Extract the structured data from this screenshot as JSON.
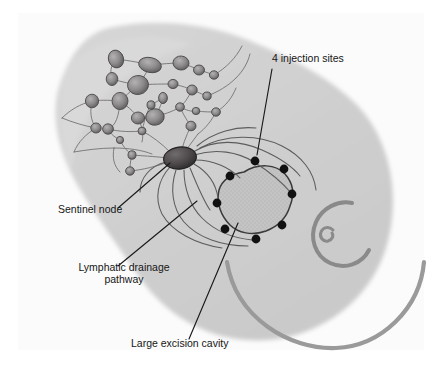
{
  "figure": {
    "kind": "medical-illustration",
    "width": 442,
    "height": 371
  },
  "colors": {
    "page_background": "#ffffff",
    "panel_background": "#fbfbfb",
    "body_silhouette": "#cfcfcf",
    "body_silhouette_light": "#d8d8d8",
    "cavity_fill": "#c2c2c2",
    "cavity_outline": "#3a3a3a",
    "sentinel_node_fill": "#4a4648",
    "lymph_node_fill": "#8e8b8d",
    "vessel_stroke": "#6d6d6d",
    "injection_dot": "#111111",
    "leader_line": "#1a1a1a",
    "label_text": "#161616",
    "areola_stroke": "#8a8a8a",
    "breast_contour": "#9a9a9a"
  },
  "labels": {
    "injection_sites": "4 injection sites",
    "sentinel_node": "Sentinel node",
    "lymphatic_drainage_line1": "Lymphatic drainage",
    "lymphatic_drainage_line2": "pathway",
    "excision_cavity": "Large excision cavity"
  },
  "anatomy": {
    "injection_site_count": 4,
    "drawn_injection_dot_count": 8,
    "sentinel_node_count": 1,
    "lymph_node_count": 26,
    "regions": [
      "axillary lymph node basin",
      "sentinel node",
      "lymphatic drainage channels",
      "large excision cavity",
      "nipple areola complex",
      "breast contour"
    ]
  },
  "injection_dots": [
    {
      "cx": 255,
      "cy": 161,
      "r": 4.4
    },
    {
      "cx": 284,
      "cy": 169,
      "r": 4.4
    },
    {
      "cx": 230,
      "cy": 176,
      "r": 4.4
    },
    {
      "cx": 292,
      "cy": 194,
      "r": 4.4
    },
    {
      "cx": 217,
      "cy": 203,
      "r": 4.4
    },
    {
      "cx": 282,
      "cy": 225,
      "r": 4.4
    },
    {
      "cx": 225,
      "cy": 229,
      "r": 4.4
    },
    {
      "cx": 256,
      "cy": 239,
      "r": 4.4
    }
  ],
  "lymph_nodes": [
    {
      "cx": 116,
      "cy": 59,
      "rx": 7.5,
      "ry": 9.0,
      "rot": -18
    },
    {
      "cx": 150,
      "cy": 65,
      "rx": 11.5,
      "ry": 7.5,
      "rot": 12
    },
    {
      "cx": 181,
      "cy": 63,
      "rx": 8.0,
      "ry": 7.0,
      "rot": 5
    },
    {
      "cx": 199,
      "cy": 70,
      "rx": 5.5,
      "ry": 5.0,
      "rot": 0
    },
    {
      "cx": 214,
      "cy": 75,
      "rx": 4.6,
      "ry": 4.2,
      "rot": 0
    },
    {
      "cx": 112,
      "cy": 79,
      "rx": 5.8,
      "ry": 6.5,
      "rot": 0
    },
    {
      "cx": 138,
      "cy": 85,
      "rx": 10.5,
      "ry": 9.5,
      "rot": -10
    },
    {
      "cx": 173,
      "cy": 84,
      "rx": 5.0,
      "ry": 4.6,
      "rot": 0
    },
    {
      "cx": 192,
      "cy": 90,
      "rx": 5.2,
      "ry": 5.0,
      "rot": 0
    },
    {
      "cx": 207,
      "cy": 96,
      "rx": 4.2,
      "ry": 4.0,
      "rot": 0
    },
    {
      "cx": 92,
      "cy": 101,
      "rx": 6.6,
      "ry": 6.8,
      "rot": 0
    },
    {
      "cx": 120,
      "cy": 101,
      "rx": 8.0,
      "ry": 8.6,
      "rot": 0
    },
    {
      "cx": 163,
      "cy": 98,
      "rx": 4.4,
      "ry": 5.6,
      "rot": 0
    },
    {
      "cx": 151,
      "cy": 105,
      "rx": 4.0,
      "ry": 4.2,
      "rot": 0
    },
    {
      "cx": 180,
      "cy": 107,
      "rx": 4.4,
      "ry": 4.2,
      "rot": 0
    },
    {
      "cx": 196,
      "cy": 111,
      "rx": 3.8,
      "ry": 3.6,
      "rot": 0
    },
    {
      "cx": 216,
      "cy": 112,
      "rx": 4.4,
      "ry": 4.2,
      "rot": 0
    },
    {
      "cx": 138,
      "cy": 118,
      "rx": 6.6,
      "ry": 6.0,
      "rot": 0
    },
    {
      "cx": 155,
      "cy": 117,
      "rx": 9.2,
      "ry": 8.2,
      "rot": -8
    },
    {
      "cx": 191,
      "cy": 126,
      "rx": 5.0,
      "ry": 4.8,
      "rot": 0
    },
    {
      "cx": 108,
      "cy": 129,
      "rx": 5.4,
      "ry": 5.2,
      "rot": 0
    },
    {
      "cx": 142,
      "cy": 131,
      "rx": 4.0,
      "ry": 3.8,
      "rot": 0
    },
    {
      "cx": 96,
      "cy": 128,
      "rx": 5.2,
      "ry": 5.0,
      "rot": 0
    },
    {
      "cx": 120,
      "cy": 140,
      "rx": 3.6,
      "ry": 3.6,
      "rot": 0
    },
    {
      "cx": 132,
      "cy": 155,
      "rx": 4.0,
      "ry": 4.2,
      "rot": 0
    },
    {
      "cx": 130,
      "cy": 171,
      "rx": 4.4,
      "ry": 4.2,
      "rot": 0
    }
  ],
  "sentinel_node": {
    "cx": 180,
    "cy": 158,
    "rx": 16.5,
    "ry": 11.0,
    "rot": -8
  },
  "annotations": [
    {
      "id": "injection-sites",
      "text_x": 272,
      "text_y": 62,
      "leader": "M 272,69 L 257,155"
    },
    {
      "id": "sentinel-node",
      "text_x": 58,
      "text_y": 213,
      "leader": "M 118,208 L 170,163"
    },
    {
      "id": "lymphatic-drainage",
      "text_x": 63,
      "text_y": 271,
      "leader": "M 118,266 L 197,201"
    },
    {
      "id": "excision-cavity",
      "text_x": 131,
      "text_y": 347,
      "leader": "M 189,339 L 238,223"
    }
  ]
}
